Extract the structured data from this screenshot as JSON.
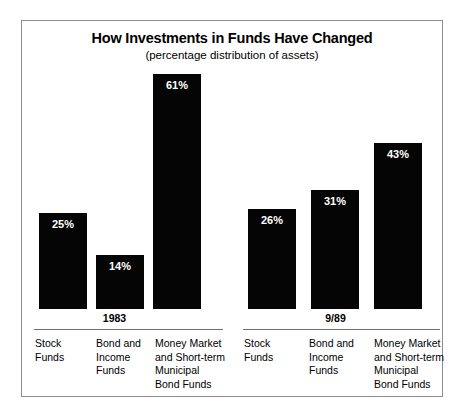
{
  "chart_data": {
    "type": "bar",
    "title": "How Investments in Funds Have Changed",
    "subtitle": "(percentage distribution of assets)",
    "xlabel": "",
    "ylabel": "",
    "ylim": [
      0,
      61
    ],
    "grid": false,
    "legend": "none",
    "value_suffix": "%",
    "categories": [
      "Stock Funds",
      "Bond and Income Funds",
      "Money Market and Short-term Municipal Bond Funds"
    ],
    "groups": [
      {
        "name": "1983",
        "bars": [
          {
            "category": "Stock Funds",
            "value": 25,
            "label": "25%"
          },
          {
            "category": "Bond and Income Funds",
            "value": 14,
            "label": "14%"
          },
          {
            "category": "Money Market and Short-term Municipal Bond Funds",
            "value": 61,
            "label": "61%"
          }
        ]
      },
      {
        "name": "9/89",
        "bars": [
          {
            "category": "Stock Funds",
            "value": 26,
            "label": "26%"
          },
          {
            "category": "Bond and Income Funds",
            "value": 31,
            "label": "31%"
          },
          {
            "category": "Money Market and Short-term Municipal Bond Funds",
            "value": 43,
            "label": "43%"
          }
        ]
      }
    ],
    "series": [
      {
        "name": "1983",
        "values": [
          25,
          14,
          61
        ]
      },
      {
        "name": "9/89",
        "values": [
          26,
          31,
          43
        ]
      }
    ],
    "category_label_lines": [
      [
        "Stock Funds"
      ],
      [
        "Bond and",
        "Income",
        "Funds"
      ],
      [
        "Money Market",
        "and Short-term",
        "Municipal",
        "Bond Funds"
      ]
    ],
    "colors": {
      "bar": "#050505",
      "value_text": "#ffffff",
      "frame": "#8d8d8d",
      "rule": "#6e6e6e",
      "background": "#ffffff",
      "text": "#000000"
    }
  }
}
